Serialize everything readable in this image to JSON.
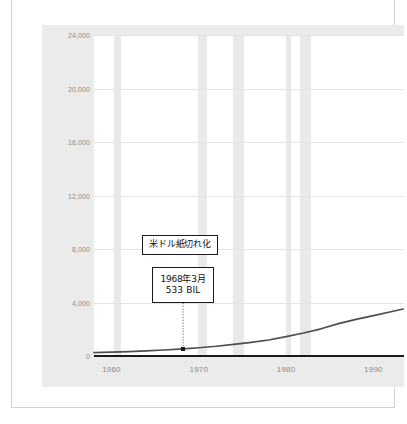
{
  "chart_data": {
    "type": "line",
    "title": "",
    "subtitle": "",
    "xlabel": "",
    "ylabel": "",
    "xlim": [
      1958,
      1993.5
    ],
    "ylim": [
      0,
      24000
    ],
    "grid": true,
    "legend_position": "none",
    "y_ticks": [
      "24,000",
      "20,000",
      "16,000",
      "12,000",
      "8,000",
      "4,000",
      "0"
    ],
    "y_tick_values": [
      24000,
      20000,
      16000,
      12000,
      8000,
      4000,
      0
    ],
    "x_ticks": [
      "1960",
      "1970",
      "1980",
      "1990"
    ],
    "x_tick_values": [
      1960,
      1970,
      1980,
      1990
    ],
    "series": [
      {
        "name": "money-supply",
        "color": "#4d4d4d",
        "x": [
          1958,
          1960,
          1962,
          1964,
          1966,
          1968.2,
          1970,
          1972,
          1974,
          1976,
          1978,
          1980,
          1982,
          1984,
          1986,
          1988,
          1990,
          1992,
          1993.4
        ],
        "values": [
          250,
          290,
          330,
          380,
          450,
          533,
          620,
          730,
          870,
          1020,
          1200,
          1450,
          1720,
          2030,
          2420,
          2740,
          3020,
          3310,
          3520
        ]
      }
    ],
    "shaded_bands": [
      {
        "label": "recession-1960",
        "start": 1960.3,
        "end": 1961.1
      },
      {
        "label": "recession-1970",
        "start": 1969.9,
        "end": 1970.9
      },
      {
        "label": "recession-1974",
        "start": 1973.9,
        "end": 1975.2
      },
      {
        "label": "recession-1980",
        "start": 1980.0,
        "end": 1980.6
      },
      {
        "label": "recession-1982",
        "start": 1981.6,
        "end": 1982.9
      }
    ],
    "annotations": [
      {
        "name": "dollar-paper-note",
        "text": "米ドル紙切れ化",
        "box": true
      },
      {
        "name": "data-point-callout",
        "date_text": "1968年3月",
        "value_text": "533 BIL",
        "point_x": 1968.2,
        "point_y": 533,
        "box": true,
        "leader": "dotted"
      }
    ],
    "colors": {
      "panel_background": "#ebebeb",
      "plot_background": "#ffffff",
      "gridline": "#e4e4e4",
      "band": "#e9e9e9",
      "line": "#4d4d4d",
      "axis_rule": "#1a1a1a",
      "tick_label": "#8a8a8a",
      "annotation_border": "#1a1a1a",
      "frame_border": "#d2d2d2"
    }
  }
}
